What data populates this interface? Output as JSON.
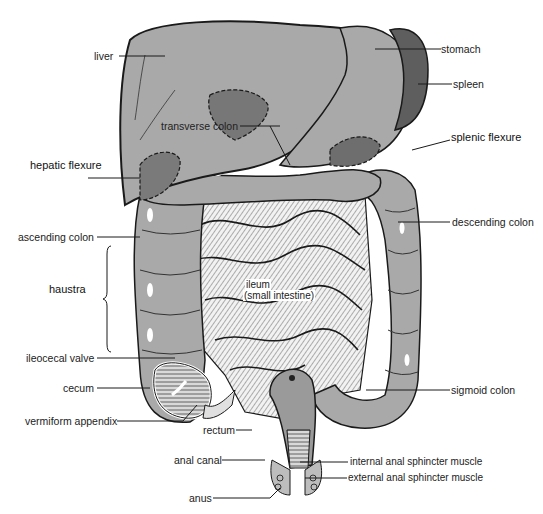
{
  "diagram": {
    "colors": {
      "organ_fill": "#a9a9a9",
      "organ_dark": "#6e6e6e",
      "spleen_fill": "#5e5e5e",
      "small_intestine_fill": "#e6e6e6",
      "outline": "#1a1a1a",
      "background": "#ffffff"
    },
    "labels": {
      "liver": "liver",
      "stomach": "stomach",
      "spleen": "spleen",
      "transverse_colon": "transverse colon",
      "splenic_flexure": "splenic flexure",
      "hepatic_flexure": "hepatic flexure",
      "descending_colon": "descending colon",
      "ascending_colon": "ascending colon",
      "haustra": "haustra",
      "ileum_line1": "ileum",
      "ileum_line2": "(small intestine)",
      "ileocecal_valve": "ileocecal valve",
      "cecum": "cecum",
      "sigmoid_colon": "sigmoid colon",
      "vermiform_appendix": "vermiform appendix",
      "rectum": "rectum",
      "anal_canal": "anal canal",
      "internal_anal_sphincter": "internal anal sphincter  muscle",
      "external_anal_sphincter": "external anal sphincter  muscle",
      "anus": "anus"
    }
  }
}
